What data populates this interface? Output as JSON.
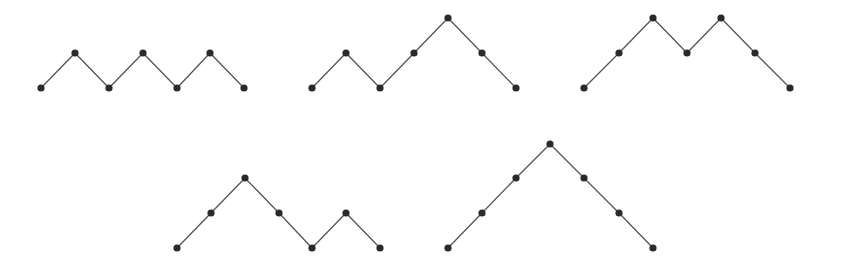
{
  "diagram": {
    "title": "",
    "colors": {
      "line": "#555555",
      "node": "#2a2a2a",
      "background": "#ffffff"
    },
    "paths": [
      {
        "id": "path-1",
        "word": "UDUDUD",
        "points": [
          [
            41,
            88
          ],
          [
            75,
            53
          ],
          [
            109,
            88
          ],
          [
            143,
            53
          ],
          [
            177,
            88
          ],
          [
            210,
            53
          ],
          [
            244,
            88
          ]
        ]
      },
      {
        "id": "path-2",
        "word": "UDUUDD",
        "points": [
          [
            312,
            88
          ],
          [
            346,
            53
          ],
          [
            380,
            88
          ],
          [
            414,
            53
          ],
          [
            448,
            18
          ],
          [
            482,
            53
          ],
          [
            516,
            88
          ]
        ]
      },
      {
        "id": "path-3",
        "word": "UUDUDD",
        "points": [
          [
            584,
            88
          ],
          [
            619,
            53
          ],
          [
            653,
            18
          ],
          [
            687,
            53
          ],
          [
            721,
            18
          ],
          [
            755,
            53
          ],
          [
            790,
            88
          ]
        ]
      },
      {
        "id": "path-4",
        "word": "UUDDUD",
        "points": [
          [
            177,
            248
          ],
          [
            211,
            213
          ],
          [
            245,
            178
          ],
          [
            279,
            213
          ],
          [
            312,
            248
          ],
          [
            346,
            213
          ],
          [
            380,
            248
          ]
        ]
      },
      {
        "id": "path-5",
        "word": "UUUDDD",
        "points": [
          [
            448,
            248
          ],
          [
            482,
            213
          ],
          [
            516,
            178
          ],
          [
            550,
            144
          ],
          [
            584,
            178
          ],
          [
            619,
            213
          ],
          [
            653,
            248
          ]
        ]
      }
    ]
  }
}
